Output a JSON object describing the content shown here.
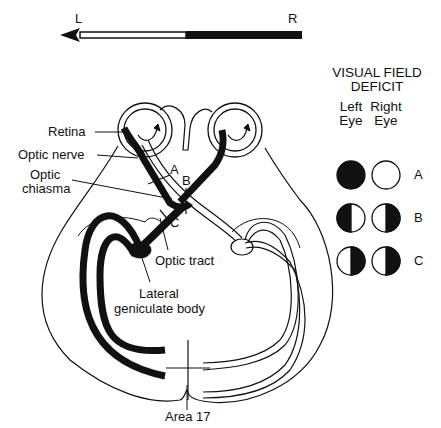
{
  "orientation": {
    "left_label": "L",
    "right_label": "R"
  },
  "labels": {
    "retina": "Retina",
    "optic_nerve": "Optic nerve",
    "optic_chiasma_line1": "Optic",
    "optic_chiasma_line2": "chiasma",
    "optic_tract": "Optic tract",
    "lgb_line1": "Lateral",
    "lgb_line2": "geniculate body",
    "area17": "Area 17",
    "lesion_a": "A",
    "lesion_b": "B",
    "lesion_c": "C"
  },
  "legend": {
    "title_line1": "VISUAL FIELD",
    "title_line2": "DEFICIT",
    "left_eye_line1": "Left",
    "left_eye_line2": "Eye",
    "right_eye_line1": "Right",
    "right_eye_line2": "Eye",
    "rows": [
      {
        "id": "A",
        "left_eye": "full-blind",
        "right_eye": "normal"
      },
      {
        "id": "B",
        "left_eye": "left-half-blind",
        "right_eye": "right-half-blind"
      },
      {
        "id": "C",
        "left_eye": "right-half-blind",
        "right_eye": "right-half-blind"
      }
    ]
  },
  "colors": {
    "ink": "#111111",
    "paper": "#ffffff"
  }
}
